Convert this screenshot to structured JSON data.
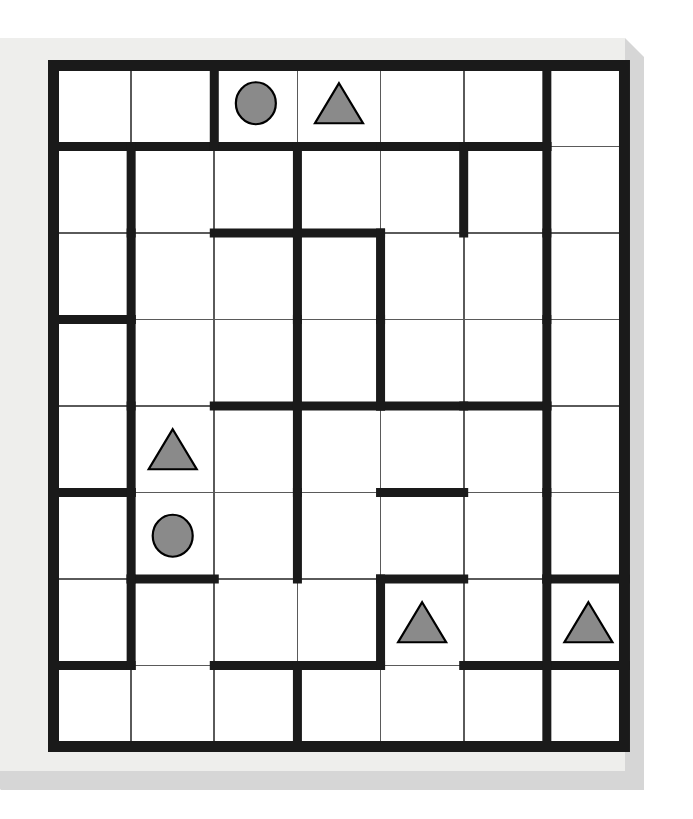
{
  "scene": {
    "title": "Grid maze puzzle board",
    "board_background": "#ffffff",
    "panel_face_color": "#eeeeec",
    "panel_shadow_color": "#d6d6d6",
    "wall_color": "#1a1a1a",
    "cell_line_color": "#5a5a5a",
    "shape_fill": "#8a8a8a",
    "shape_stroke": "#000000"
  },
  "grid": {
    "columns": 7,
    "rows": 8,
    "origin_x": 48,
    "origin_y": 60,
    "cell_width": 83.14,
    "cell_height": 86.5,
    "outer_wall_thickness": 11,
    "inner_wall_thickness": 9,
    "thin_line_thickness": 1.6
  },
  "shapes": [
    {
      "id": "circle-r0c2",
      "type": "circle",
      "row": 0,
      "col": 2,
      "label": "circle"
    },
    {
      "id": "triangle-r0c3",
      "type": "triangle",
      "row": 0,
      "col": 3,
      "label": "triangle"
    },
    {
      "id": "triangle-r4c1",
      "type": "triangle",
      "row": 4,
      "col": 1,
      "label": "triangle"
    },
    {
      "id": "circle-r5c1",
      "type": "circle",
      "row": 5,
      "col": 1,
      "label": "circle"
    },
    {
      "id": "triangle-r6c4",
      "type": "triangle",
      "row": 6,
      "col": 4,
      "label": "triangle"
    },
    {
      "id": "triangle-r6c6",
      "type": "triangle",
      "row": 6,
      "col": 6,
      "label": "triangle"
    }
  ],
  "walls": {
    "comment": "h = horizontal wall segments below-row boundaries; v = vertical wall segments right-of-column boundaries. Format [rowIndexOfBoundary, colIndex].",
    "horizontal": [
      [
        0,
        0
      ],
      [
        0,
        1
      ],
      [
        0,
        2
      ],
      [
        0,
        3
      ],
      [
        0,
        4
      ],
      [
        0,
        5
      ],
      [
        1,
        2
      ],
      [
        1,
        3
      ],
      [
        2,
        0
      ],
      [
        3,
        2
      ],
      [
        3,
        3
      ],
      [
        3,
        4
      ],
      [
        3,
        5
      ],
      [
        4,
        0
      ],
      [
        4,
        4
      ],
      [
        5,
        1
      ],
      [
        5,
        4
      ],
      [
        5,
        6
      ],
      [
        6,
        0
      ],
      [
        6,
        2
      ],
      [
        6,
        3
      ],
      [
        6,
        5
      ],
      [
        6,
        6
      ]
    ],
    "vertical": [
      [
        0,
        1
      ],
      [
        0,
        5
      ],
      [
        1,
        0
      ],
      [
        1,
        2
      ],
      [
        1,
        4
      ],
      [
        1,
        5
      ],
      [
        2,
        0
      ],
      [
        2,
        2
      ],
      [
        2,
        3
      ],
      [
        2,
        5
      ],
      [
        3,
        0
      ],
      [
        3,
        2
      ],
      [
        3,
        5
      ],
      [
        3,
        3
      ],
      [
        4,
        0
      ],
      [
        4,
        2
      ],
      [
        4,
        5
      ],
      [
        5,
        0
      ],
      [
        5,
        2
      ],
      [
        5,
        5
      ],
      [
        6,
        0
      ],
      [
        6,
        3
      ],
      [
        6,
        5
      ],
      [
        7,
        2
      ],
      [
        7,
        5
      ]
    ]
  }
}
